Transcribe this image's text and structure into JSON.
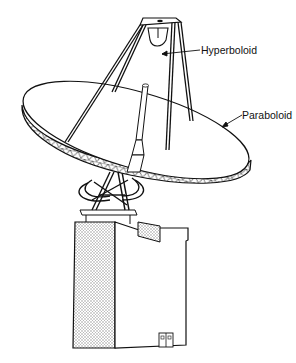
{
  "diagram": {
    "labels": {
      "hyperboloid": "Hyperboloid",
      "paraboloid": "Paraboloid"
    },
    "colors": {
      "line": "#111111",
      "background": "#ffffff",
      "shading": "#bdbdbd"
    }
  }
}
